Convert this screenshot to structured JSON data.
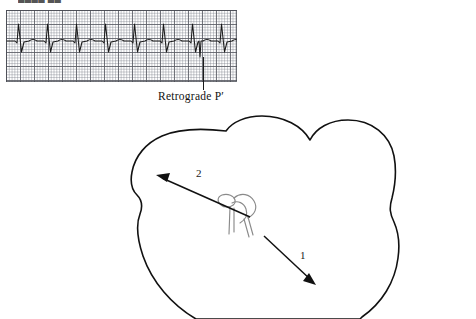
{
  "figure": {
    "kind": "medical-illustration",
    "clipped_header_text": "████ ██"
  },
  "ecg": {
    "label": "ecg-rhythm-strip",
    "grid": {
      "small_box_px": 2.8,
      "large_box_px": 14,
      "fine_line_color": "#787c87",
      "heavy_line_color": "#5a5c64",
      "border_color": "#464850",
      "paper_color": "#ffffff"
    },
    "trace_color": "#1a1a1a",
    "beat_count": 8,
    "beat_spacing_px": 29,
    "first_beat_x": 14,
    "baseline_y": 41,
    "marked_beat_index": 6,
    "morphology": {
      "r_wave_height_px": 17,
      "s_wave_depth_px": 11,
      "t_wave_height_px": 3,
      "retrograde_p_depth_px": 16
    }
  },
  "annotations": {
    "retrograde_p": {
      "text": "Retrograde P′",
      "pointer_x": 203,
      "pointer_top": 57,
      "pointer_bottom": 90
    }
  },
  "heart": {
    "label": "heart-outline",
    "stroke_color": "#111111",
    "stroke_width": 1.6,
    "fill": "none",
    "conduction_system": {
      "label": "av-node-his-bundle",
      "stroke_color": "#8a8a8a",
      "stroke_width": 1.1
    },
    "arrows": [
      {
        "id": "1",
        "label": "1",
        "name": "arrow-antegrade-to-ventricle",
        "direction": "down-right",
        "from": [
          264,
          236
        ],
        "to": [
          315,
          284
        ],
        "label_pos": [
          300,
          249
        ]
      },
      {
        "id": "2",
        "label": "2",
        "name": "arrow-retrograde-to-atrium",
        "direction": "up-left",
        "from": [
          249,
          216
        ],
        "to": [
          157,
          176
        ],
        "label_pos": [
          196,
          167
        ]
      }
    ]
  },
  "colors": {
    "ink": "#111111",
    "gray_ink": "#8a8a8a",
    "background": "#ffffff"
  }
}
